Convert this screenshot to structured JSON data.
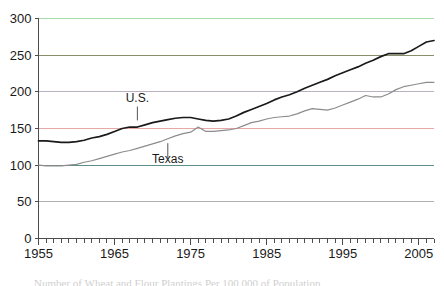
{
  "chart_data": {
    "type": "line",
    "title": "",
    "xlabel": "",
    "ylabel": "",
    "xlim": [
      1955,
      2007
    ],
    "ylim": [
      0,
      300
    ],
    "yticks": [
      0,
      50,
      100,
      150,
      200,
      250,
      300
    ],
    "ytick_labels": [
      "0",
      "50",
      "100",
      "150",
      "200",
      "250",
      "300"
    ],
    "xticks": [
      1955,
      1965,
      1975,
      1985,
      1995,
      2005
    ],
    "xtick_labels": [
      "1955",
      "1965",
      "1975",
      "1985",
      "1995",
      "2005"
    ],
    "minor_xtick_interval": 1,
    "grid": "horizontal",
    "legend_position": "inline-annotations",
    "gridline_colors": {
      "0": "#808080",
      "50": "#b0b0b0",
      "100": "#5a8f8a",
      "150": "#e8a8a8",
      "200": "#b9b0c4",
      "250": "#8a8f6a",
      "300": "#a8dca8"
    },
    "x": [
      1955,
      1956,
      1957,
      1958,
      1959,
      1960,
      1961,
      1962,
      1963,
      1964,
      1965,
      1966,
      1967,
      1968,
      1969,
      1970,
      1971,
      1972,
      1973,
      1974,
      1975,
      1976,
      1977,
      1978,
      1979,
      1980,
      1981,
      1982,
      1983,
      1984,
      1985,
      1986,
      1987,
      1988,
      1989,
      1990,
      1991,
      1992,
      1993,
      1994,
      1995,
      1996,
      1997,
      1998,
      1999,
      2000,
      2001,
      2002,
      2003,
      2004,
      2005,
      2006,
      2007
    ],
    "series": [
      {
        "name": "U.S.",
        "color": "#1a1a1a",
        "label_x": 1968,
        "label_y": 186,
        "values": [
          133,
          133,
          132,
          131,
          131,
          132,
          134,
          137,
          139,
          142,
          146,
          150,
          152,
          152,
          155,
          158,
          160,
          162,
          164,
          165,
          165,
          163,
          161,
          160,
          161,
          163,
          167,
          172,
          176,
          180,
          184,
          189,
          193,
          196,
          200,
          205,
          209,
          213,
          217,
          222,
          226,
          230,
          234,
          239,
          243,
          248,
          252,
          252,
          252,
          256,
          262,
          268,
          270
        ]
      },
      {
        "name": "Texas",
        "color": "#8c8c8c",
        "label_x": 1972,
        "label_y": 103,
        "values": [
          100,
          99,
          99,
          99,
          100,
          101,
          104,
          106,
          109,
          112,
          115,
          118,
          120,
          123,
          126,
          129,
          132,
          136,
          140,
          143,
          145,
          152,
          146,
          146,
          147,
          148,
          150,
          154,
          158,
          160,
          163,
          165,
          166,
          167,
          170,
          174,
          177,
          176,
          175,
          178,
          182,
          186,
          190,
          195,
          193,
          193,
          197,
          203,
          207,
          209,
          211,
          213,
          213
        ]
      }
    ],
    "annotations": [
      {
        "name": "us-leader-line",
        "from_x": 1968,
        "from_y": 180,
        "to_x": 1968,
        "to_y": 161
      },
      {
        "name": "texas-leader-line",
        "from_x": 1972,
        "from_y": 110,
        "to_x": 1972,
        "to_y": 130
      }
    ]
  },
  "caption": {
    "text": "Number of Wheat and Flour Plantings Per 100,000 of Population"
  }
}
